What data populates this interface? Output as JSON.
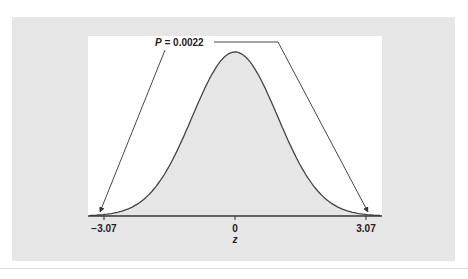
{
  "chart_data": {
    "type": "area",
    "title": "",
    "xlabel": "z",
    "ylabel": "",
    "distribution": "standard normal",
    "x_ticks": [
      -3.07,
      0,
      3.07
    ],
    "x_tick_labels": [
      "−3.07",
      "0",
      "3.07"
    ],
    "shaded_region": "entire area under curve",
    "annotation": {
      "text": "P = 0.0022",
      "p_symbol": "P",
      "p_value": "0.0022",
      "points_to": [
        -3.07,
        3.07
      ],
      "meaning": "two-tailed probability beyond |z| = 3.07"
    },
    "grid": false,
    "legend": null,
    "colors": {
      "fill": "#e6e6e6",
      "curve": "#444444",
      "axis": "#333333",
      "panel": "#e6e6e6",
      "plot_bg": "#ffffff"
    }
  },
  "labels": {
    "p_symbol": "P",
    "p_rest": " = 0.0022",
    "tick_left": "−3.07",
    "tick_center": "0",
    "tick_right": "3.07",
    "axis_label": "z"
  }
}
